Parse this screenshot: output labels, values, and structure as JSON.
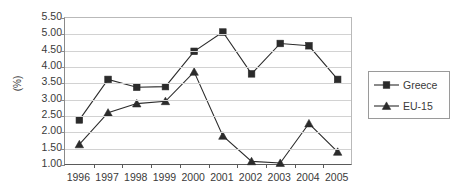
{
  "chart_data": {
    "type": "line",
    "title": "",
    "subtitle": "",
    "xlabel": "",
    "ylabel": "(%)",
    "categories": [
      "1996",
      "1997",
      "1998",
      "1999",
      "2000",
      "2001",
      "2002",
      "2003",
      "2004",
      "2005"
    ],
    "ylim": [
      1.0,
      5.5
    ],
    "ytick_labels": [
      "5.50",
      "5.00",
      "4.50",
      "4.00",
      "3.50",
      "3.00",
      "2.50",
      "2.00",
      "1.50",
      "1.00"
    ],
    "ytick_values": [
      5.5,
      5.0,
      4.5,
      4.0,
      3.5,
      3.0,
      2.5,
      2.0,
      1.5,
      1.0
    ],
    "ytick_interval": 0.5,
    "grid": "horizontal",
    "legend_position": "right",
    "series": [
      {
        "name": "Greece",
        "marker": "square",
        "color": "#2b2b2b",
        "values": [
          2.38,
          3.62,
          3.38,
          3.4,
          4.48,
          5.07,
          3.79,
          4.72,
          4.65,
          3.62
        ]
      },
      {
        "name": "EU-15",
        "marker": "triangle",
        "color": "#2b2b2b",
        "values": [
          1.63,
          2.6,
          2.88,
          2.95,
          3.85,
          1.89,
          1.11,
          1.06,
          2.27,
          1.4
        ]
      }
    ]
  },
  "legend": {
    "entries": [
      {
        "label": "Greece",
        "marker": "square-marker-icon"
      },
      {
        "label": "EU-15",
        "marker": "triangle-marker-icon"
      }
    ]
  },
  "colors": {
    "series_line": "#2b2b2b",
    "gridline": "#d2d2d2",
    "axis": "#5a5a5a",
    "text": "#3a3a3a",
    "background": "#ffffff"
  }
}
